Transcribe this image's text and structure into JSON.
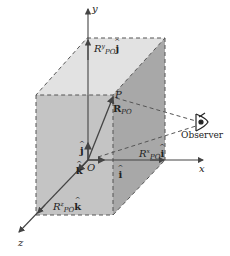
{
  "diagram": {
    "colors": {
      "top_face": "#e2e2e2",
      "front_face": "#c4c4c4",
      "right_face": "#a8a8a8",
      "edge": "#555555",
      "axis": "#444444"
    },
    "axes": {
      "x": "x",
      "y": "y",
      "z": "z"
    },
    "origin_label": "O",
    "point_label": "P",
    "vector_label": {
      "main": "R",
      "sub": "PO"
    },
    "unit_vectors": {
      "i": "i",
      "j": "j",
      "k": "k"
    },
    "components": {
      "x": {
        "coef": "R",
        "sup": "x",
        "sub": "PO",
        "unit": "i"
      },
      "y": {
        "coef": "R",
        "sup": "y",
        "sub": "PO",
        "unit": "j"
      },
      "z": {
        "coef": "R",
        "sup": "z",
        "sub": "PO",
        "unit": "k"
      }
    },
    "observer_label": "Observer",
    "observer_icon": "eye-icon"
  }
}
